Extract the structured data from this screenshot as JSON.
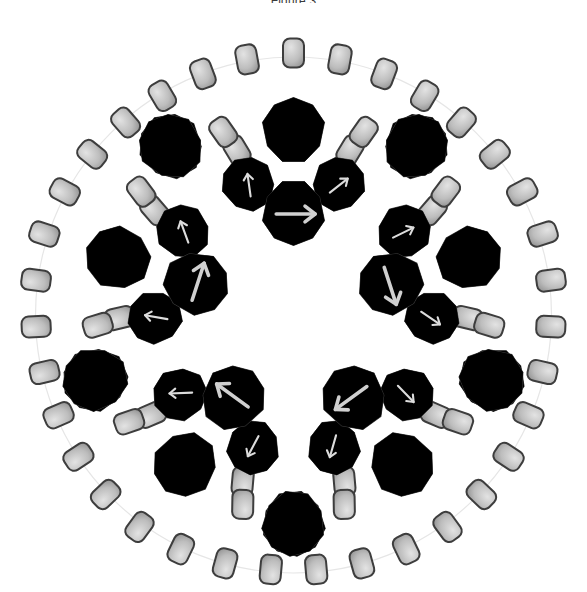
{
  "figure": {
    "title": "Figure 3",
    "caption_visible": false,
    "symmetry": "C5 (five-fold rotational)",
    "background_color": "#ffffff",
    "width": 587,
    "height": 592
  },
  "palette": {
    "background": "#ffffff",
    "dark_cage_fill": "#6e6e6e",
    "dark_cage_fill_light": "#838383",
    "dark_cage_stroke": "#3a3a3a",
    "medium_cage_fill": "#ababab",
    "medium_cage_fill_light": "#bfbfbf",
    "medium_cage_stroke": "#4a4a4a",
    "pale_cage_fill": "#f1f1f1",
    "pale_cage_fill_light": "#fbfbfb",
    "pale_cage_stroke": "#8e8e8e",
    "linker_fill": "#b5b5b5",
    "linker_fill_light": "#d2d2d2",
    "linker_stroke": "#3d3d3d",
    "arrow_light": "#cfcfcf",
    "arrow_pale": "#dedede",
    "guide_circle": "#e2e2e2"
  },
  "structure": {
    "center": {
      "x": 293.5,
      "y": 315
    },
    "sector_count": 5,
    "sector_angle_deg": 72,
    "rings": [
      {
        "name": "inner-dark-ring",
        "ring_index": 1,
        "unit_type": "dodecahedral-cage",
        "unit_count": 5,
        "radius": 103,
        "fill": "#6e6e6e",
        "scale": 0.62,
        "has_arrow": true,
        "arrow_color": "#cfcfcf",
        "arrow_note": "each dark cage carries a pale arrow indicating tilt/orientation"
      },
      {
        "name": "middle-pale-ring",
        "ring_index": 2,
        "unit_type": "dodecahedral-cage",
        "unit_count": 10,
        "radius": 172,
        "fill": "#f1f1f1",
        "scale": 0.52,
        "has_arrow": true,
        "arrow_color": "#dedede"
      },
      {
        "name": "outer-medium-ring",
        "ring_index": 3,
        "unit_type": "dodecahedral-cage",
        "unit_count": 10,
        "radius": 222,
        "fill": "#ababab",
        "scale": 0.62,
        "has_arrow": false
      }
    ],
    "linker_ring": {
      "name": "outer-linker-ring",
      "unit_type": "rounded-rectangle-linker",
      "unit_count": 35,
      "per_sector": 7,
      "radius": 262,
      "width": 21,
      "height": 29,
      "corner_radius": 7,
      "fill": "#b5b5b5",
      "stroke": "#3d3d3d"
    },
    "junction_linkers": {
      "name": "junction-linker-pairs",
      "unit_type": "rounded-rectangle-linker",
      "pair_count": 10,
      "description": "paired linkers bridging apex cages to flanking cages at each vertex"
    }
  },
  "legend": {
    "items": [
      {
        "swatch": "#6e6e6e",
        "label": "inner cage"
      },
      {
        "swatch": "#ababab",
        "label": "outer cage"
      },
      {
        "swatch": "#f1f1f1",
        "label": "pale cage"
      },
      {
        "swatch": "#b5b5b5",
        "label": "linker"
      }
    ],
    "visible": false
  },
  "annotations": {
    "arrows_visible": true,
    "arrow_count": 15,
    "arrow_description": "pale directional arrows drawn on the shaded cage faces"
  }
}
